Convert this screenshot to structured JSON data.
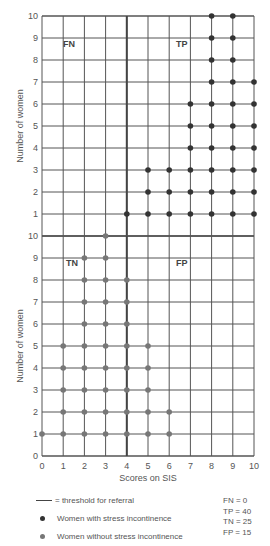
{
  "chart_data": [
    {
      "type": "scatter",
      "panel": "upper",
      "title": "",
      "xlabel": "Scores on SIS",
      "ylabel": "Number of women",
      "xlim": [
        0,
        10
      ],
      "ylim": [
        0,
        10
      ],
      "x_ticks": [
        0,
        1,
        2,
        3,
        4,
        5,
        6,
        7,
        8,
        9,
        10
      ],
      "y_ticks": [
        1,
        2,
        3,
        4,
        5,
        6,
        7,
        8,
        9,
        10
      ],
      "series": [
        {
          "name": "Women with stress incontinence",
          "color": "#333333",
          "counts_by_score": {
            "0": 0,
            "1": 0,
            "2": 0,
            "3": 0,
            "4": 1,
            "5": 3,
            "6": 3,
            "7": 6,
            "8": 10,
            "9": 10,
            "10": 7
          }
        }
      ],
      "quadrant_labels": [
        "FN",
        "TP"
      ],
      "grid": true,
      "threshold_x": 4
    },
    {
      "type": "scatter",
      "panel": "lower",
      "title": "",
      "xlabel": "Scores on SIS",
      "ylabel": "Number of women",
      "xlim": [
        0,
        10
      ],
      "ylim": [
        0,
        10
      ],
      "x_ticks": [
        0,
        1,
        2,
        3,
        4,
        5,
        6,
        7,
        8,
        9,
        10
      ],
      "y_ticks": [
        0,
        1,
        2,
        3,
        4,
        5,
        6,
        7,
        8,
        9,
        10
      ],
      "series": [
        {
          "name": "Women without stress incontinence",
          "color": "#777777",
          "counts_by_score": {
            "0": 1,
            "1": 5,
            "2": 9,
            "3": 10,
            "4": 8,
            "5": 5,
            "6": 2,
            "7": 0,
            "8": 0,
            "9": 0,
            "10": 0
          }
        }
      ],
      "quadrant_labels": [
        "TN",
        "FP"
      ],
      "grid": true,
      "threshold_x": 4
    }
  ],
  "labels": {
    "fn": "FN",
    "tp": "TP",
    "tn": "TN",
    "fp": "FP",
    "xlabel": "Scores on SIS",
    "ylabel_upper": "Number of women",
    "ylabel_lower": "Number of women"
  },
  "legend": {
    "threshold": "= threshold for referral",
    "with_si": "Women with stress incontinence",
    "without_si": "Women without stress incontinence"
  },
  "stats": {
    "fn": "FN = 0",
    "tp": "TP = 40",
    "tn": "TN = 25",
    "fp": "FP = 15"
  },
  "colors": {
    "grid": "#555555",
    "threshold": "#444444",
    "with_si": "#333333",
    "without_si": "#777777"
  }
}
